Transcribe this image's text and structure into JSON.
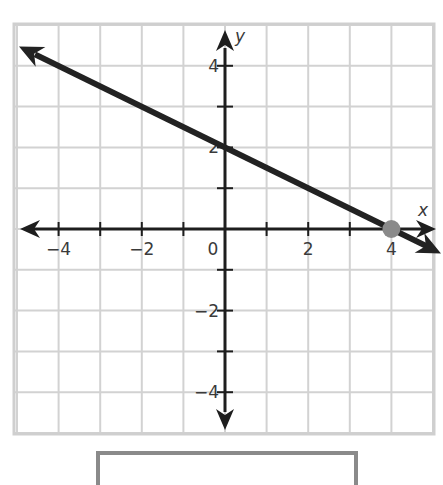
{
  "chart_data": {
    "type": "line",
    "title": "",
    "xlabel": "x",
    "ylabel": "y",
    "xlim": [
      -5,
      5
    ],
    "ylim": [
      -5,
      5
    ],
    "grid": true,
    "grid_step": 1,
    "x_tick_labels": [
      "-4",
      "-2",
      "0",
      "2",
      "4"
    ],
    "y_tick_labels": [
      "4",
      "2",
      "-2",
      "-4"
    ],
    "series": [
      {
        "name": "line",
        "type": "ray-line",
        "slope": -0.5,
        "y_intercept": 2,
        "x": [
          -5,
          0,
          4,
          5
        ],
        "y": [
          4.5,
          2,
          0,
          -0.5
        ],
        "arrows": "both",
        "color": "#222222"
      }
    ],
    "points": [
      {
        "x": 4,
        "y": 0,
        "color": "#8a8a8a"
      }
    ]
  },
  "colors": {
    "grid": "#d2d2d2",
    "frame": "#cfcfcf",
    "axis": "#1e1e1e",
    "line": "#222222",
    "point": "#8a8a8a",
    "answer_box_border": "#8a8a8a",
    "label": "#3a3a3a"
  },
  "answer_box": {
    "value": ""
  }
}
